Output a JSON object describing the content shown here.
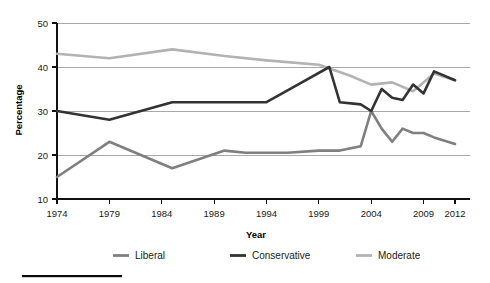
{
  "chart_data": {
    "type": "line",
    "title": "",
    "xlabel": "Year",
    "ylabel": "Percentage",
    "xlim": [
      1974,
      2012
    ],
    "ylim": [
      10,
      50
    ],
    "grid": true,
    "legend_position": "bottom",
    "xtick_labels": [
      "1974",
      "1979",
      "1984",
      "1989",
      "1994",
      "1999",
      "2004",
      "2009",
      "2012"
    ],
    "xtick_values": [
      1974,
      1979,
      1984,
      1989,
      1994,
      1999,
      2004,
      2009,
      2012
    ],
    "ytick_labels": [
      "10",
      "20",
      "30",
      "40",
      "50"
    ],
    "ytick_values": [
      10,
      20,
      30,
      40,
      50
    ],
    "series": [
      {
        "name": "Liberal",
        "color": "#7f7f7f",
        "x": [
          1974,
          1979,
          1985,
          1990,
          1992,
          1996,
          1999,
          2001,
          2003,
          2004,
          2005,
          2006,
          2007,
          2008,
          2009,
          2010,
          2012
        ],
        "values": [
          15,
          23,
          17,
          21,
          20.5,
          20.5,
          21,
          21,
          22,
          30,
          26,
          23,
          26,
          25,
          25,
          24,
          22.5
        ]
      },
      {
        "name": "Conservative",
        "color": "#333333",
        "x": [
          1974,
          1979,
          1985,
          1990,
          1994,
          1997,
          2000,
          2001,
          2003,
          2004,
          2005,
          2006,
          2007,
          2008,
          2009,
          2010,
          2012
        ],
        "values": [
          30,
          28,
          32,
          32,
          32,
          36,
          40,
          32,
          31.5,
          30,
          35,
          33,
          32.5,
          36,
          34,
          39,
          37
        ]
      },
      {
        "name": "Moderate",
        "color": "#b3b3b3",
        "x": [
          1974,
          1979,
          1985,
          1990,
          1994,
          1999,
          2002,
          2004,
          2006,
          2008,
          2010,
          2012
        ],
        "values": [
          43,
          42,
          44,
          42.5,
          41.5,
          40.5,
          38,
          36,
          36.5,
          34.5,
          38.5,
          37
        ]
      }
    ]
  },
  "legend": {
    "items": [
      {
        "label": "Liberal",
        "color": "#7f7f7f"
      },
      {
        "label": "Conservative",
        "color": "#333333"
      },
      {
        "label": "Moderate",
        "color": "#b3b3b3"
      }
    ]
  },
  "axes": {
    "y_title": "Percentage",
    "x_title": "Year"
  }
}
